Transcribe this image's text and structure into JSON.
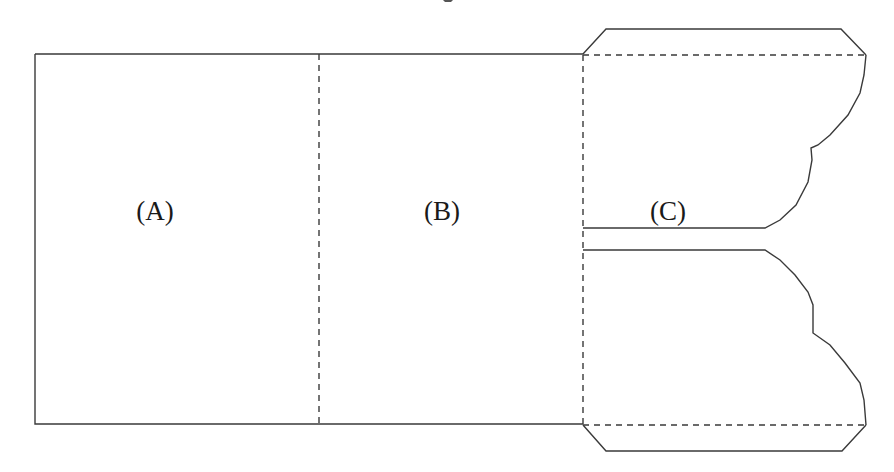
{
  "diagram": {
    "type": "folder-die-cut-template",
    "panels": [
      {
        "id": "A",
        "label": "(A)",
        "label_pos": [
          155,
          211
        ]
      },
      {
        "id": "B",
        "label": "(B)",
        "label_pos": [
          442,
          211
        ]
      },
      {
        "id": "C",
        "label": "(C)",
        "label_pos": [
          668,
          211
        ]
      }
    ],
    "fold_lines": {
      "style": "dashed",
      "lines": [
        {
          "name": "fold-A-B",
          "from": [
            319,
            54
          ],
          "to": [
            319,
            424
          ]
        },
        {
          "name": "fold-B-C",
          "from": [
            583,
            54
          ],
          "to": [
            583,
            424
          ]
        },
        {
          "name": "fold-top-tab",
          "from": [
            583,
            55
          ],
          "to": [
            866,
            55
          ]
        },
        {
          "name": "fold-bottom-tab",
          "from": [
            583,
            425
          ],
          "to": [
            866,
            425
          ]
        }
      ]
    },
    "colors": {
      "stroke": "#3a3a3a",
      "background": "#ffffff",
      "text": "#1a1a1a"
    }
  }
}
